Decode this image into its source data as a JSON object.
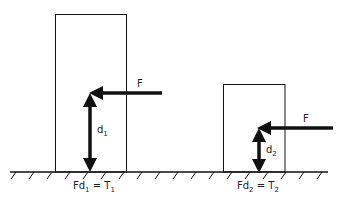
{
  "diagram": {
    "left": {
      "force_label": "F",
      "distance_label": "d",
      "distance_sub": "1",
      "equation": {
        "lhs": "Fd",
        "lhs_sub": "1",
        "eq": " = ",
        "rhs": "T",
        "rhs_sub": "1"
      }
    },
    "right": {
      "force_label": "F",
      "distance_label": "d",
      "distance_sub": "2",
      "equation": {
        "lhs": "Fd",
        "lhs_sub": "2",
        "eq": " = ",
        "rhs": "T",
        "rhs_sub": "2"
      }
    },
    "colors": {
      "line": "#111111",
      "background": "#ffffff"
    }
  }
}
